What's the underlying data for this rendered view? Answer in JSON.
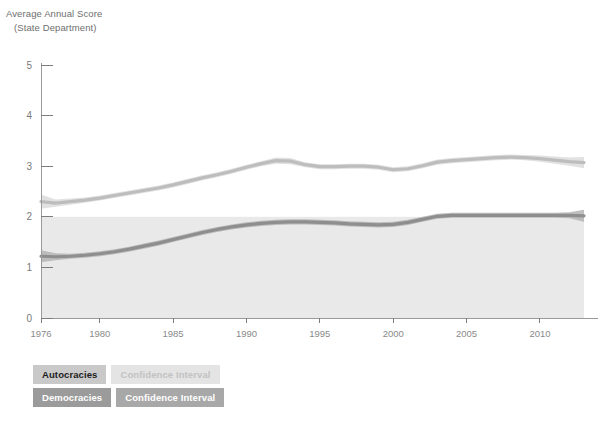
{
  "axis_title": {
    "line1": "Average Annual Score",
    "line2": "(State Department)"
  },
  "legend": {
    "row1": {
      "series_label": "Autocracies",
      "ci_label": "Confidence Interval"
    },
    "row2": {
      "series_label": "Democracies",
      "ci_label": "Confidence Interval"
    }
  },
  "colors": {
    "democracies_line": "#bdbdbd",
    "democracies_band": "#dcdcdc",
    "autocracies_line": "#8e8e8e",
    "autocracies_band": "#b4b4b4",
    "shaded_region": "#e9e9e9",
    "axis": "#9a9a9a",
    "tick_text": "#7a7a7a"
  },
  "chart_data": {
    "type": "line",
    "title": "",
    "subtitle": "",
    "xlabel": "",
    "ylabel": "Average Annual Score (State Department)",
    "xlim": [
      1976,
      2013
    ],
    "ylim": [
      0,
      5
    ],
    "yticks": [
      0,
      1,
      2,
      3,
      4,
      5
    ],
    "xticks": [
      1976,
      1980,
      1985,
      1990,
      1995,
      2000,
      2005,
      2010
    ],
    "grid": false,
    "legend_position": "below-left",
    "shaded_band": {
      "from": 0,
      "to": 2,
      "note": "light shaded region below score 2"
    },
    "x": [
      1976,
      1977,
      1978,
      1979,
      1980,
      1981,
      1982,
      1983,
      1984,
      1985,
      1986,
      1987,
      1988,
      1989,
      1990,
      1991,
      1992,
      1993,
      1994,
      1995,
      1996,
      1997,
      1998,
      1999,
      2000,
      2001,
      2002,
      2003,
      2004,
      2005,
      2006,
      2007,
      2008,
      2009,
      2010,
      2011,
      2012,
      2013
    ],
    "series": [
      {
        "name": "Democracies",
        "values": [
          2.3,
          2.27,
          2.3,
          2.33,
          2.37,
          2.42,
          2.47,
          2.52,
          2.57,
          2.63,
          2.7,
          2.77,
          2.83,
          2.9,
          2.98,
          3.05,
          3.11,
          3.1,
          3.03,
          2.99,
          2.99,
          3.0,
          3.0,
          2.98,
          2.93,
          2.95,
          3.01,
          3.08,
          3.11,
          3.13,
          3.15,
          3.17,
          3.18,
          3.17,
          3.15,
          3.12,
          3.09,
          3.07
        ],
        "ci_lower": [
          2.16,
          2.2,
          2.24,
          2.28,
          2.32,
          2.37,
          2.42,
          2.47,
          2.52,
          2.58,
          2.65,
          2.72,
          2.78,
          2.85,
          2.93,
          3.0,
          3.05,
          3.04,
          2.98,
          2.94,
          2.94,
          2.95,
          2.95,
          2.93,
          2.88,
          2.9,
          2.96,
          3.03,
          3.06,
          3.08,
          3.1,
          3.12,
          3.13,
          3.12,
          3.09,
          3.05,
          3.01,
          2.96
        ],
        "ci_upper": [
          2.44,
          2.34,
          2.36,
          2.38,
          2.42,
          2.47,
          2.52,
          2.57,
          2.62,
          2.68,
          2.75,
          2.82,
          2.88,
          2.95,
          3.03,
          3.1,
          3.17,
          3.16,
          3.08,
          3.04,
          3.04,
          3.05,
          3.05,
          3.03,
          2.98,
          3.0,
          3.06,
          3.13,
          3.16,
          3.18,
          3.2,
          3.22,
          3.23,
          3.22,
          3.21,
          3.19,
          3.17,
          3.18
        ]
      },
      {
        "name": "Autocracies",
        "values": [
          1.22,
          1.21,
          1.22,
          1.24,
          1.27,
          1.31,
          1.36,
          1.42,
          1.48,
          1.55,
          1.62,
          1.69,
          1.75,
          1.8,
          1.84,
          1.87,
          1.89,
          1.9,
          1.9,
          1.89,
          1.88,
          1.86,
          1.85,
          1.84,
          1.85,
          1.89,
          1.95,
          2.01,
          2.03,
          2.03,
          2.03,
          2.03,
          2.03,
          2.03,
          2.03,
          2.03,
          2.03,
          2.02
        ],
        "ci_lower": [
          1.1,
          1.14,
          1.17,
          1.19,
          1.22,
          1.26,
          1.31,
          1.37,
          1.43,
          1.5,
          1.57,
          1.64,
          1.7,
          1.75,
          1.79,
          1.82,
          1.84,
          1.85,
          1.85,
          1.84,
          1.83,
          1.81,
          1.8,
          1.79,
          1.8,
          1.84,
          1.9,
          1.96,
          1.98,
          1.98,
          1.98,
          1.98,
          1.98,
          1.98,
          1.98,
          1.98,
          1.97,
          1.9
        ],
        "ci_upper": [
          1.34,
          1.28,
          1.27,
          1.29,
          1.32,
          1.36,
          1.41,
          1.47,
          1.53,
          1.6,
          1.67,
          1.74,
          1.8,
          1.85,
          1.89,
          1.92,
          1.94,
          1.95,
          1.95,
          1.94,
          1.93,
          1.91,
          1.9,
          1.89,
          1.9,
          1.94,
          2.0,
          2.06,
          2.08,
          2.08,
          2.08,
          2.08,
          2.08,
          2.08,
          2.08,
          2.08,
          2.09,
          2.14
        ]
      }
    ]
  }
}
